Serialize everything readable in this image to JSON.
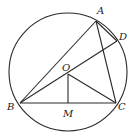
{
  "diagram": {
    "type": "geometry-circle-inscribed-triangle",
    "circle": {
      "center_label": "O",
      "cx": 68,
      "cy": 72,
      "r": 59
    },
    "points": {
      "A": {
        "label": "A",
        "x": 96,
        "y": 21,
        "lx": 97,
        "ly": 14
      },
      "D": {
        "label": "D",
        "x": 117,
        "y": 41,
        "lx": 119,
        "ly": 40
      },
      "B": {
        "label": "B",
        "x": 20,
        "y": 103,
        "lx": 7,
        "ly": 110
      },
      "C": {
        "label": "C",
        "x": 116,
        "y": 103,
        "lx": 118,
        "ly": 110
      },
      "O": {
        "label": "O",
        "x": 68,
        "y": 74,
        "lx": 62,
        "ly": 71
      },
      "M": {
        "label": "M",
        "x": 68,
        "y": 103,
        "lx": 63,
        "ly": 117
      }
    },
    "segments": [
      [
        "A",
        "B"
      ],
      [
        "A",
        "C"
      ],
      [
        "A",
        "D"
      ],
      [
        "B",
        "C"
      ],
      [
        "B",
        "D"
      ],
      [
        "O",
        "M"
      ],
      [
        "O",
        "C"
      ]
    ],
    "colors": {
      "line": "#2a2a2a",
      "background": "#ffffff"
    }
  }
}
